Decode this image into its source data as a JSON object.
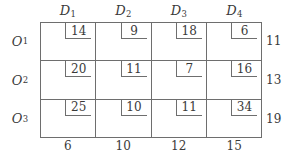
{
  "table": {
    "column_headers": [
      "D",
      "D",
      "D",
      "D"
    ],
    "column_header_subs": [
      "1",
      "2",
      "3",
      "4"
    ],
    "row_headers": [
      "O",
      "O",
      "O"
    ],
    "row_header_subs": [
      "1",
      "2",
      "3"
    ],
    "costs": [
      [
        14,
        9,
        18,
        6
      ],
      [
        20,
        11,
        7,
        16
      ],
      [
        25,
        10,
        11,
        34
      ]
    ],
    "supplies": [
      11,
      13,
      19
    ],
    "demands": [
      6,
      10,
      12,
      15
    ],
    "colors": {
      "line": "#6e6e6e",
      "text": "#3a3a3a",
      "background": "#ffffff"
    }
  },
  "chart_data": {
    "type": "table",
    "title": "",
    "xlabel": "",
    "ylabel": "",
    "categories": [
      "D1",
      "D2",
      "D3",
      "D4"
    ],
    "row_labels": [
      "O1",
      "O2",
      "O3"
    ],
    "series": [
      {
        "name": "O1",
        "values": [
          14,
          9,
          18,
          6
        ]
      },
      {
        "name": "O2",
        "values": [
          20,
          11,
          7,
          16
        ]
      },
      {
        "name": "O3",
        "values": [
          25,
          10,
          11,
          34
        ]
      }
    ],
    "supplies": [
      11,
      13,
      19
    ],
    "demands": [
      6,
      10,
      12,
      15
    ],
    "total_supply": 43,
    "total_demand": 43
  }
}
